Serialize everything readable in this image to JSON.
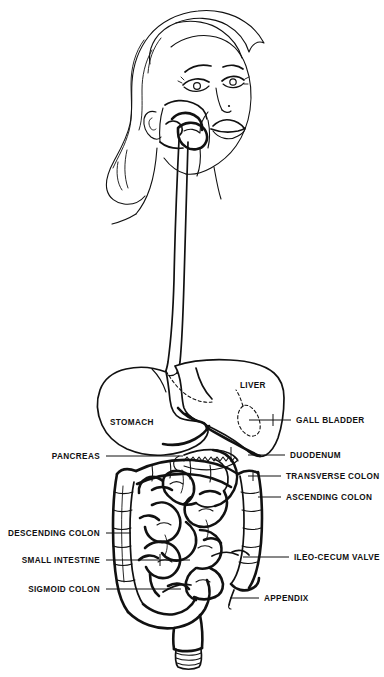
{
  "figure": {
    "background_color": "#ffffff",
    "line_color": "#111111",
    "width": 384,
    "height": 677
  },
  "labels": {
    "left": [
      {
        "id": "pancreas",
        "text": "PANCREAS",
        "text_x": 100,
        "text_y": 459,
        "line_x1": 106,
        "line_x2": 183,
        "line_y": 456
      },
      {
        "id": "descending_colon",
        "text": "DESCENDING COLON",
        "text_x": 100,
        "text_y": 536,
        "line_x1": 106,
        "line_x2": 131,
        "line_y": 533
      },
      {
        "id": "small_intestine",
        "text": "SMALL INTESTINE",
        "text_x": 100,
        "text_y": 563,
        "line_x1": 106,
        "line_x2": 190,
        "line_y": 560
      },
      {
        "id": "sigmoid_colon",
        "text": "SIGMOID COLON",
        "text_x": 100,
        "text_y": 592,
        "line_x1": 106,
        "line_x2": 181,
        "line_y": 589
      }
    ],
    "right": [
      {
        "id": "gall_bladder",
        "text": "GALL BLADDER",
        "text_x": 296,
        "text_y": 423,
        "line_x1": 249,
        "line_x2": 291,
        "line_y": 420
      },
      {
        "id": "duodenum",
        "text": "DUODENUM",
        "text_x": 290,
        "text_y": 458,
        "line_x1": 248,
        "line_x2": 285,
        "line_y": 455
      },
      {
        "id": "transverse_colon",
        "text": "TRANSVERSE COLON",
        "text_x": 286,
        "text_y": 479,
        "line_x1": 248,
        "line_x2": 281,
        "line_y": 476
      },
      {
        "id": "ascending_colon",
        "text": "ASCENDING COLON",
        "text_x": 286,
        "text_y": 500,
        "line_x1": 258,
        "line_x2": 281,
        "line_y": 497
      },
      {
        "id": "ileo_cecum_valve",
        "text": "ILEO-CECUM VALVE",
        "text_x": 294,
        "text_y": 560,
        "line_x1": 243,
        "line_x2": 289,
        "line_y": 557
      },
      {
        "id": "appendix",
        "text": "APPENDIX",
        "text_x": 264,
        "text_y": 601,
        "line_x1": 230,
        "line_x2": 259,
        "line_y": 598
      }
    ],
    "inline": [
      {
        "id": "liver",
        "text": "LIVER",
        "text_x": 240,
        "text_y": 388
      },
      {
        "id": "stomach",
        "text": "STOMACH",
        "text_x": 110,
        "text_y": 425
      }
    ]
  }
}
